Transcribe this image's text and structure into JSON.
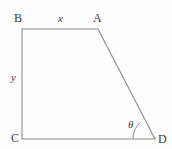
{
  "figure": {
    "type": "geometry-diagram",
    "shape": "trapezoid",
    "background_color": "#fefefe",
    "stroke_color": "#8a8a8a",
    "label_color": "#3a3a3a",
    "vertices": [
      {
        "name": "B",
        "label": "B",
        "x": 22,
        "y": 29
      },
      {
        "name": "A",
        "label": "A",
        "x": 98,
        "y": 29
      },
      {
        "name": "D",
        "label": "D",
        "x": 155,
        "y": 139
      },
      {
        "name": "C",
        "label": "C",
        "x": 22,
        "y": 139
      }
    ],
    "side_labels": [
      {
        "name": "top-side",
        "label": "x",
        "style": "italic"
      },
      {
        "name": "left-side",
        "label": "y",
        "style": "italic"
      }
    ],
    "angle_labels": [
      {
        "name": "angle-at-D",
        "label": "θ",
        "vertex": "D"
      }
    ],
    "polygon_points": "22,29 98,29 155,139 22,139",
    "angle_arc_path": "M 133.0,139 A 22,22 0 0 1 140.36,122.44"
  }
}
